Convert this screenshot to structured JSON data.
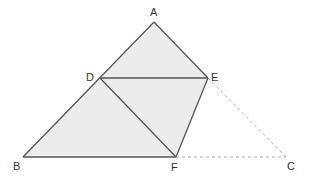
{
  "diagram": {
    "type": "geometry",
    "points": {
      "A": {
        "label": "A",
        "x": 154,
        "y": 22
      },
      "B": {
        "label": "B",
        "x": 23,
        "y": 157
      },
      "C": {
        "label": "C",
        "x": 286,
        "y": 157
      },
      "D": {
        "label": "D",
        "x": 100,
        "y": 78
      },
      "E": {
        "label": "E",
        "x": 208,
        "y": 78
      },
      "F": {
        "label": "F",
        "x": 176,
        "y": 157
      }
    },
    "shaded_region": [
      "A",
      "D",
      "B",
      "F",
      "E"
    ],
    "solid_segments": [
      [
        "A",
        "B"
      ],
      [
        "B",
        "F"
      ],
      [
        "F",
        "E"
      ],
      [
        "E",
        "A"
      ],
      [
        "D",
        "E"
      ],
      [
        "D",
        "F"
      ]
    ],
    "dashed_segments": [
      [
        "E",
        "C"
      ],
      [
        "F",
        "C"
      ]
    ],
    "colors": {
      "fill": "#ececec",
      "line": "#555555",
      "dashed": "#aaaaaa",
      "label": "#333333"
    }
  },
  "labels": {
    "A": "A",
    "B": "B",
    "C": "C",
    "D": "D",
    "E": "E",
    "F": "F"
  }
}
